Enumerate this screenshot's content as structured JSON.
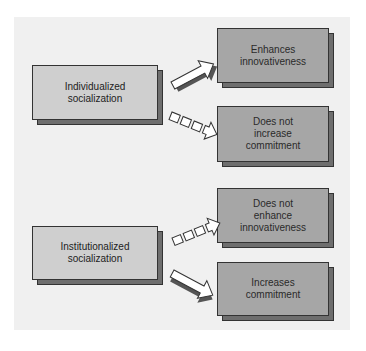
{
  "diagram": {
    "sources": [
      {
        "label": "Individualized\nsocialization"
      },
      {
        "label": "Institutionalized\nsocialization"
      }
    ],
    "outcomes": [
      {
        "label": "Enhances\ninnovativeness"
      },
      {
        "label": "Does not\nincrease\ncommitment"
      },
      {
        "label": "Does not\nenhance\ninnovativeness"
      },
      {
        "label": "Increases\ncommitment"
      }
    ],
    "links": [
      {
        "from": "Individualized socialization",
        "to": "Enhances innovativeness",
        "style": "solid"
      },
      {
        "from": "Individualized socialization",
        "to": "Does not increase commitment",
        "style": "dashed"
      },
      {
        "from": "Institutionalized socialization",
        "to": "Does not enhance innovativeness",
        "style": "dashed"
      },
      {
        "from": "Institutionalized socialization",
        "to": "Increases commitment",
        "style": "solid"
      }
    ],
    "colors": {
      "panel": "#f0f0f0",
      "source_fill": "#cfcfcf",
      "outcome_fill": "#a6a6a6",
      "shadow": "#6e6e6e"
    }
  }
}
